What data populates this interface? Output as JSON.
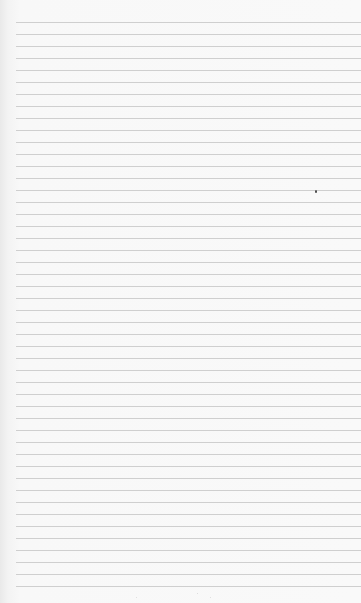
{
  "page": {
    "type": "lined-paper",
    "background_color": "#f9f9f9",
    "edge_shade_color": "#e9e9e9",
    "rule_color": "#cfcfcf",
    "rule_left_px": 16,
    "first_rule_y_px": 22,
    "rule_spacing_px": 12,
    "rule_count": 48
  },
  "marks": [
    {
      "name": "ink-dot",
      "x": 315,
      "y": 190,
      "size": 2,
      "color": "#444444"
    },
    {
      "name": "speck",
      "x": 136,
      "y": 597,
      "size": 1,
      "color": "#d8d8d8"
    },
    {
      "name": "speck",
      "x": 197,
      "y": 593,
      "size": 1,
      "color": "#d4d4d4"
    },
    {
      "name": "speck",
      "x": 210,
      "y": 597,
      "size": 1,
      "color": "#d8d8d8"
    }
  ]
}
